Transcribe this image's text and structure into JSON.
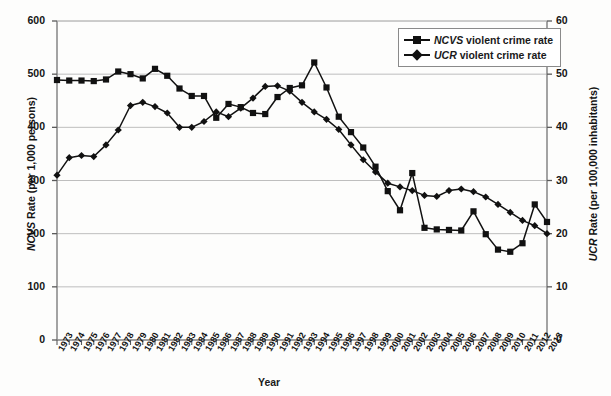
{
  "axes": {
    "left_title_italic": "NCVS",
    "left_title_rest": " Rate (per 1,000 persons)",
    "right_title_italic": "UCR",
    "right_title_rest": " Rate (per 100,000 inhabitants)",
    "xlabel": "Year",
    "left_ticks": [
      "600",
      "500",
      "400",
      "300",
      "200",
      "100",
      "0"
    ],
    "right_ticks": [
      "60",
      "50",
      "40",
      "30",
      "20",
      "10",
      "0"
    ]
  },
  "legend": {
    "items": [
      {
        "italic": "NCVS",
        "rest": " violent crime rate",
        "marker": "square-marker"
      },
      {
        "italic": "UCR",
        "rest": " violent crime rate",
        "marker": "diamond-marker"
      }
    ]
  },
  "chart_data": {
    "type": "line",
    "title": "",
    "xlabel": "Year",
    "ylabel": "NCVS Rate (per 1,000 persons)",
    "y2label": "UCR Rate (per 100,000 inhabitants)",
    "ylim": [
      0,
      600
    ],
    "y2lim": [
      0,
      60
    ],
    "grid": true,
    "legend_position": "top-right",
    "x": [
      1973,
      1974,
      1975,
      1976,
      1977,
      1978,
      1979,
      1980,
      1981,
      1982,
      1983,
      1984,
      1985,
      1986,
      1987,
      1988,
      1989,
      1990,
      1991,
      1992,
      1993,
      1994,
      1995,
      1996,
      1997,
      1998,
      1999,
      2000,
      2001,
      2002,
      2003,
      2004,
      2005,
      2006,
      2007,
      2008,
      2009,
      2010,
      2011,
      2012,
      2013
    ],
    "series": [
      {
        "name": "NCVS violent crime rate",
        "axis": "left",
        "marker": "square",
        "values": [
          489,
          488,
          488,
          487,
          490,
          505,
          500,
          492,
          510,
          497,
          473,
          459,
          459,
          418,
          444,
          438,
          427,
          425,
          457,
          474,
          479,
          522,
          475,
          420,
          391,
          362,
          326,
          280,
          244,
          314,
          211,
          208,
          207,
          206,
          242,
          199,
          170,
          166,
          182,
          255,
          222
        ]
      },
      {
        "name": "UCR violent crime rate",
        "axis": "right",
        "marker": "diamond",
        "values": [
          31.0,
          34.3,
          34.7,
          34.5,
          36.7,
          39.5,
          44.1,
          44.7,
          43.9,
          42.7,
          40.0,
          40.0,
          41.1,
          42.9,
          42.0,
          43.6,
          45.5,
          47.7,
          47.8,
          46.8,
          44.7,
          42.9,
          41.5,
          39.6,
          36.7,
          33.9,
          31.6,
          29.5,
          28.8,
          28.1,
          27.2,
          27.0,
          28.1,
          28.4,
          27.9,
          26.9,
          25.5,
          24.0,
          22.5,
          21.5,
          20.0
        ]
      }
    ]
  }
}
